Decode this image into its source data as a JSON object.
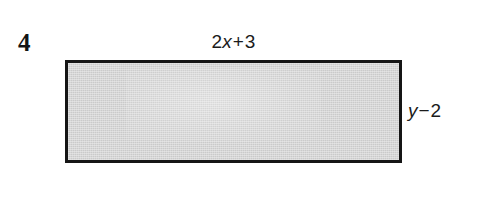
{
  "figure": {
    "problem_number": "4",
    "shape": {
      "kind": "rectangle",
      "fill_color": "#d2d2d2",
      "stroke_color": "#151515",
      "stroke_width_px": 3
    },
    "labels": {
      "top": {
        "full_text": "2x + 3",
        "coefficient": "2",
        "variable": "x",
        "operator": "+",
        "constant": "3",
        "position": "above-top-edge",
        "describes": "width"
      },
      "right": {
        "full_text": "y − 2",
        "variable": "y",
        "operator": "−",
        "constant": "2",
        "position": "right-of-right-edge",
        "describes": "height"
      }
    }
  }
}
